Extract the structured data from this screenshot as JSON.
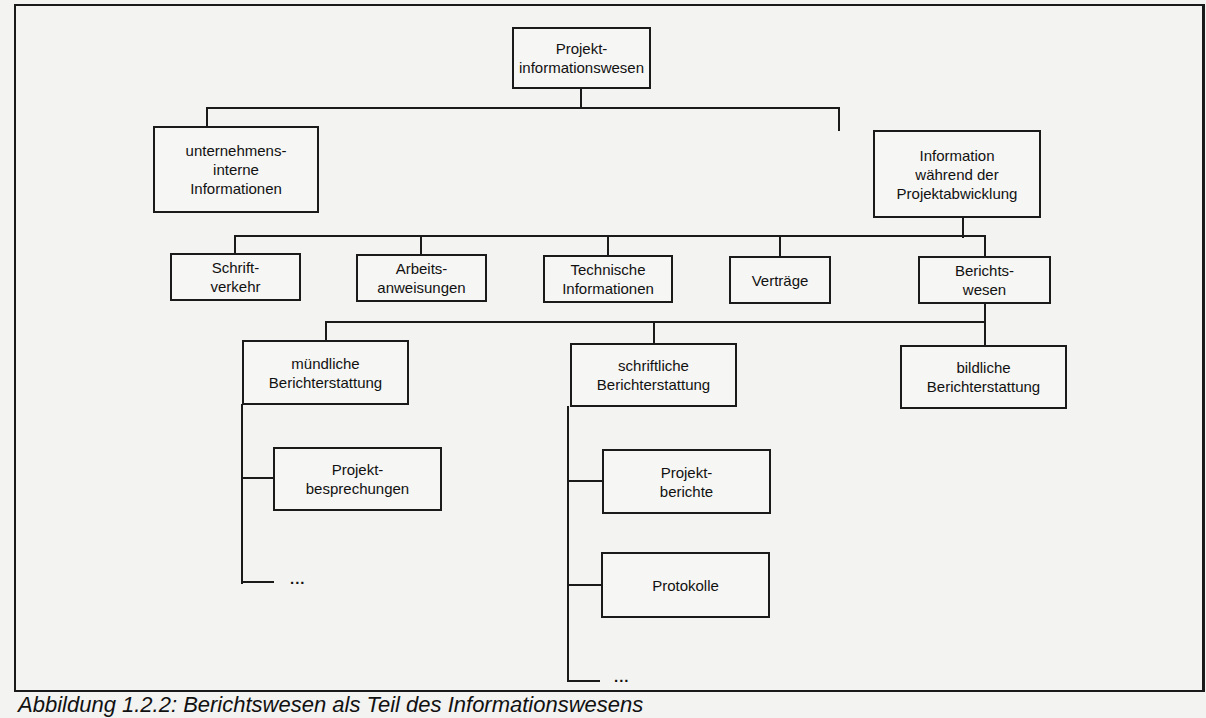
{
  "diagram": {
    "type": "hierarchy",
    "root": {
      "id": "root",
      "label": "Projekt-\ninformationswesen"
    },
    "nodes": {
      "root": {
        "label": "Projekt-\ninformationswesen"
      },
      "internal": {
        "label": "unternehmens-\ninterne\nInformationen"
      },
      "during": {
        "label": "Information\nwährend der\nProjektabwicklung"
      },
      "schriftverkehr": {
        "label": "Schrift-\nverkehr"
      },
      "arbeitsanweisungen": {
        "label": "Arbeits-\nanweisungen"
      },
      "technische": {
        "label": "Technische\nInformationen"
      },
      "vertraege": {
        "label": "Verträge"
      },
      "berichtswesen": {
        "label": "Berichts-\nwesen"
      },
      "muendlich": {
        "label": "mündliche\nBerichterstattung"
      },
      "schriftlich": {
        "label": "schriftliche\nBerichterstattung"
      },
      "bildlich": {
        "label": "bildliche\nBerichterstattung"
      },
      "besprechungen": {
        "label": "Projekt-\nbesprechungen"
      },
      "berichte": {
        "label": "Projekt-\nberichte"
      },
      "protokolle": {
        "label": "Protokolle"
      }
    },
    "edges": [
      [
        "root",
        "internal"
      ],
      [
        "root",
        "during"
      ],
      [
        "during",
        "schriftverkehr"
      ],
      [
        "during",
        "arbeitsanweisungen"
      ],
      [
        "during",
        "technische"
      ],
      [
        "during",
        "vertraege"
      ],
      [
        "during",
        "berichtswesen"
      ],
      [
        "berichtswesen",
        "muendlich"
      ],
      [
        "berichtswesen",
        "schriftlich"
      ],
      [
        "berichtswesen",
        "bildlich"
      ],
      [
        "muendlich",
        "besprechungen"
      ],
      [
        "muendlich",
        "..."
      ],
      [
        "schriftlich",
        "berichte"
      ],
      [
        "schriftlich",
        "protokolle"
      ],
      [
        "schriftlich",
        "..."
      ]
    ],
    "ellipsis": "..."
  },
  "caption": "Abbildung 1.2.2: Berichtswesen als Teil des Informationswesens"
}
